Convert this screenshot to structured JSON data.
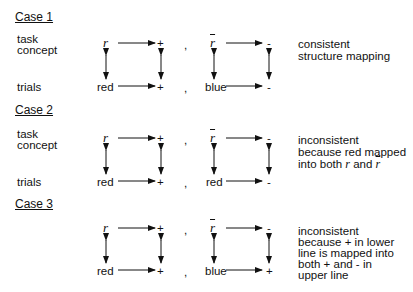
{
  "cases": [
    {
      "title": "Case 1",
      "labels": {
        "task": "task",
        "concept": "concept",
        "trials": "trials"
      },
      "left": {
        "top_left": "r",
        "top_right": "+",
        "bottom_left": "red",
        "bottom_right": "+"
      },
      "separator": ",",
      "right": {
        "top_left": "r",
        "top_right": "-",
        "bottom_left": "blue",
        "bottom_right": "-"
      },
      "description": [
        "consistent",
        "structure mapping"
      ]
    },
    {
      "title": "Case 2",
      "labels": {
        "task": "task",
        "concept": "concept",
        "trials": "trials"
      },
      "left": {
        "top_left": "r",
        "top_right": "+",
        "bottom_left": "red",
        "bottom_right": "+"
      },
      "separator": ",",
      "right": {
        "top_left": "r",
        "top_right": "-",
        "bottom_left": "red",
        "bottom_right": "-"
      },
      "description": [
        "inconsistent",
        "because red mapped",
        "into both",
        "r",
        "and",
        "r"
      ]
    },
    {
      "title": "Case 3",
      "left": {
        "top_left": "r",
        "top_right": "+",
        "bottom_left": "red",
        "bottom_right": "+"
      },
      "separator": ",",
      "right": {
        "top_left": "r",
        "top_right": "-",
        "bottom_left": "blue",
        "bottom_right": "+"
      },
      "description": [
        "inconsistent",
        "because + in lower",
        "line is mapped into",
        "both + and - in",
        "upper line"
      ]
    }
  ]
}
